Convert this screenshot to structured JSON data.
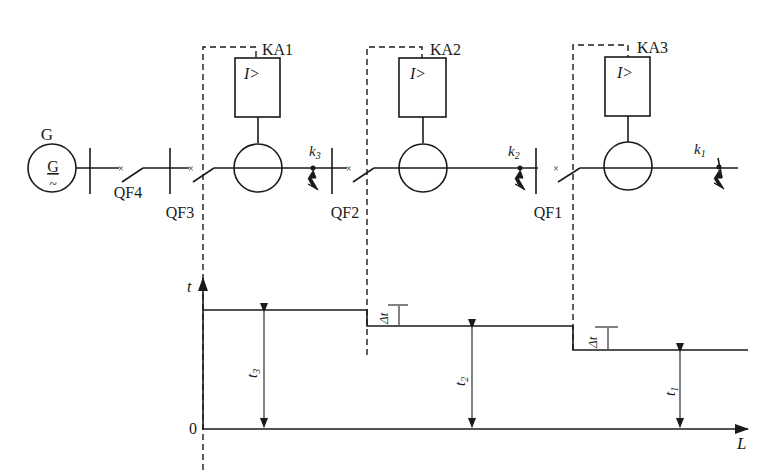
{
  "diagram": {
    "type": "single-line protection diagram with time-distance characteristic",
    "generator": {
      "label": "G",
      "symbol": "G",
      "symbol_sub": "~"
    },
    "breakers": [
      {
        "id": "QF4",
        "label": "QF4"
      },
      {
        "id": "QF3",
        "label": "QF3"
      },
      {
        "id": "QF2",
        "label": "QF2"
      },
      {
        "id": "QF1",
        "label": "QF1"
      }
    ],
    "relays": [
      {
        "id": "KA1",
        "label": "KA1",
        "function": "I>"
      },
      {
        "id": "KA2",
        "label": "KA2",
        "function": "I>"
      },
      {
        "id": "KA3",
        "label": "KA3",
        "function": "I>"
      }
    ],
    "fault_points": [
      {
        "id": "k3",
        "label": "k",
        "sub": "3"
      },
      {
        "id": "k2",
        "label": "k",
        "sub": "2"
      },
      {
        "id": "k1",
        "label": "k",
        "sub": "1"
      }
    ],
    "time_chart": {
      "y_axis_label": "t",
      "x_axis_label": "L",
      "origin_label": "0",
      "delta_label": "Δt",
      "steps": [
        {
          "label": "t",
          "sub": "3"
        },
        {
          "label": "t",
          "sub": "2"
        },
        {
          "label": "t",
          "sub": "1"
        }
      ]
    }
  }
}
